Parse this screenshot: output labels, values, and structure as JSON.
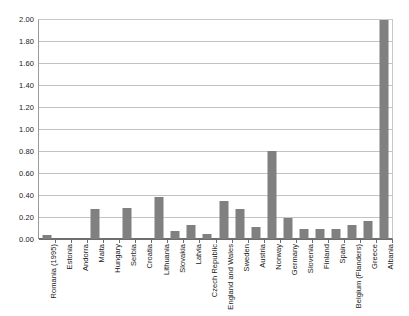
{
  "chart_data": {
    "type": "bar",
    "title": "",
    "subtitle": "",
    "xlabel": "",
    "ylabel": "",
    "ylim": [
      0.0,
      2.0
    ],
    "ytick_labels": [
      "2.00",
      "1.80",
      "1.60",
      "1.40",
      "1.20",
      "1.00",
      "0.80",
      "0.60",
      "0.40",
      "0.20",
      "0.00"
    ],
    "ytick_values": [
      2.0,
      1.8,
      1.6,
      1.4,
      1.2,
      1.0,
      0.8,
      0.6,
      0.4,
      0.2,
      0.0
    ],
    "grid": true,
    "legend": false,
    "legend_position": "none",
    "bar_color": "#808080",
    "categories": [
      "Romania (1995)",
      "Estonia",
      "Andorra",
      "Malta",
      "Hungary",
      "Serbia",
      "Croatia",
      "Lithuania",
      "Slovakia",
      "Latvia",
      "Czech Republic",
      "England and Wales",
      "Sweden",
      "Austria",
      "Norway",
      "Germany",
      "Slovenia",
      "Finland",
      "Spain",
      "Belgium (Flanders)",
      "Greece",
      "Albania"
    ],
    "values": [
      0.04,
      0.0,
      0.0,
      0.27,
      0.0,
      0.28,
      0.0,
      0.38,
      0.07,
      0.13,
      0.05,
      0.35,
      0.27,
      0.11,
      0.8,
      0.19,
      0.09,
      0.09,
      0.09,
      0.13,
      0.16,
      1.99
    ]
  }
}
